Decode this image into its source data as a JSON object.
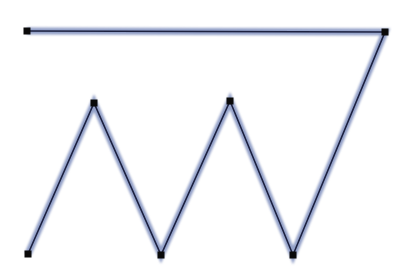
{
  "diagram": {
    "type": "polyline",
    "colors": {
      "background": "#ffffff",
      "halo": "#93a0c8",
      "stroke": "#1c2140",
      "handle": "#0a0a0a"
    },
    "halo_width": 7,
    "stroke_width": 1.6,
    "handle_size": 7,
    "points": [
      {
        "x": 27,
        "y": 31
      },
      {
        "x": 385,
        "y": 32
      },
      {
        "x": 293,
        "y": 255
      },
      {
        "x": 230,
        "y": 101
      },
      {
        "x": 161,
        "y": 255
      },
      {
        "x": 94,
        "y": 103
      },
      {
        "x": 28,
        "y": 254
      }
    ]
  }
}
